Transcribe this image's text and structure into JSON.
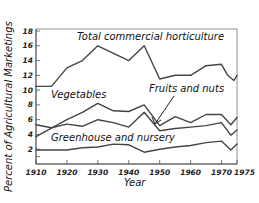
{
  "chart_data": {
    "type": "line",
    "title": "",
    "xlabel": "Year",
    "ylabel": "Percent of Agricultural Marketings",
    "xlim": [
      1910,
      1975
    ],
    "ylim": [
      0,
      18
    ],
    "grid": false,
    "legend": "inline labels",
    "x_ticks": [
      1910,
      1920,
      1930,
      1940,
      1950,
      1960,
      1970,
      1975
    ],
    "x_tick_labels": [
      "1910",
      "1920",
      "1930",
      "1940",
      "1950",
      "1960",
      "1970",
      "1975"
    ],
    "y_ticks": [
      2,
      4,
      6,
      8,
      10,
      12,
      14,
      16,
      18
    ],
    "y_tick_labels": [
      "2",
      "4",
      "6",
      "8",
      "10",
      "12",
      "14",
      "16",
      "18"
    ],
    "series": [
      {
        "name": "Total commercial horticulture",
        "x": [
          1910,
          1915,
          1920,
          1925,
          1930,
          1940,
          1945,
          1950,
          1955,
          1960,
          1965,
          1970,
          1972,
          1974,
          1975
        ],
        "values": [
          10.5,
          10.5,
          13,
          14,
          16,
          14,
          16,
          11.5,
          12,
          12,
          13.3,
          13.5,
          12,
          11.3,
          12
        ]
      },
      {
        "name": "Vegetables",
        "x": [
          1910,
          1920,
          1925,
          1930,
          1935,
          1940,
          1945,
          1950,
          1955,
          1960,
          1965,
          1970,
          1973,
          1975
        ],
        "values": [
          3.7,
          6,
          7,
          8.2,
          7.2,
          7.1,
          8,
          5.2,
          6.4,
          5.6,
          6.7,
          6.7,
          5.3,
          6.3
        ]
      },
      {
        "name": "Fruits and nuts",
        "x": [
          1910,
          1915,
          1920,
          1925,
          1930,
          1935,
          1940,
          1945,
          1950,
          1955,
          1960,
          1965,
          1970,
          1973,
          1975
        ],
        "values": [
          5.3,
          4.9,
          5.4,
          5.1,
          6,
          5.6,
          5,
          7,
          4.5,
          4.8,
          5,
          5.2,
          5.6,
          3.9,
          4.6
        ]
      },
      {
        "name": "Greenhouse and nursery",
        "x": [
          1910,
          1920,
          1925,
          1930,
          1935,
          1940,
          1945,
          1950,
          1955,
          1960,
          1965,
          1970,
          1973,
          1975
        ],
        "values": [
          1.9,
          1.9,
          2.2,
          2.3,
          2.7,
          2.6,
          1.6,
          2.0,
          2.3,
          2.5,
          2.9,
          3.1,
          1.9,
          2.7
        ]
      }
    ],
    "annotations": [
      {
        "text": "Total commercial horticulture",
        "series": "Total commercial horticulture"
      },
      {
        "text": "Vegetables",
        "series": "Vegetables"
      },
      {
        "text": "Fruits and nuts",
        "series": "Fruits and nuts",
        "arrow": true
      },
      {
        "text": "Greenhouse and nursery",
        "series": "Greenhouse and nursery"
      }
    ]
  },
  "labels": {
    "total": "Total commercial horticulture",
    "vegetables": "Vegetables",
    "fruits": "Fruits and nuts",
    "greenhouse": "Greenhouse and nursery",
    "xlabel": "Year",
    "ylabel": "Percent of Agricultural Marketings"
  }
}
